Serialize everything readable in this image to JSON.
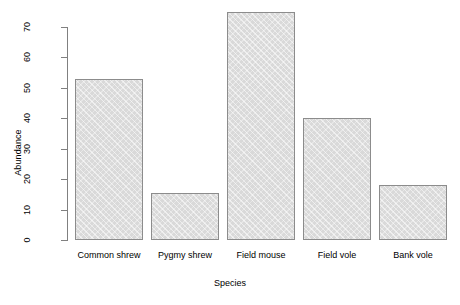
{
  "chart_data": {
    "type": "bar",
    "title": "",
    "xlabel": "Species",
    "ylabel": "Abundance",
    "categories": [
      "Common shrew",
      "Pygmy shrew",
      "Field mouse",
      "Field vole",
      "Bank vole"
    ],
    "values": [
      53,
      15.5,
      75,
      40,
      18
    ],
    "ylim": [
      0,
      70
    ],
    "yticks": [
      0,
      10,
      20,
      30,
      40,
      50,
      60,
      70
    ],
    "ytick_labels": [
      "0",
      "10",
      "20",
      "30",
      "40",
      "50",
      "60",
      "70"
    ],
    "grid": false,
    "legend": false,
    "bar_fill_color": "#d9d9d9",
    "bar_border_color": "#8c8c8c",
    "axis_color": "#808080",
    "background_color": "#ffffff"
  }
}
